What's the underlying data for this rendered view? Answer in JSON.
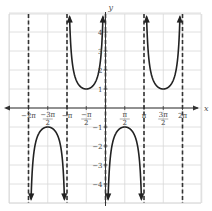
{
  "chart_data": {
    "type": "line",
    "title": "",
    "function": "y = -csc(x)",
    "xlabel": "x",
    "ylabel": "y",
    "xlim": [
      -2.5,
      2.5
    ],
    "xlim_units": "pi",
    "ylim": [
      -5,
      5
    ],
    "grid": true,
    "x_tick_labels": [
      "-2π",
      "-3π/2",
      "-π",
      "-π/2",
      "π/2",
      "π",
      "3π/2",
      "2π"
    ],
    "x_tick_values_pi": [
      -2,
      -1.5,
      -1,
      -0.5,
      0.5,
      1,
      1.5,
      2
    ],
    "y_tick_labels": [
      "-4",
      "-3",
      "-2",
      "-1",
      "1",
      "2",
      "3",
      "4"
    ],
    "y_tick_values": [
      -4,
      -3,
      -2,
      -1,
      1,
      2,
      3,
      4
    ],
    "asymptotes_pi": [
      -2,
      -1,
      0,
      1,
      2
    ],
    "series": [
      {
        "name": "branch-1",
        "domain_pi": [
          -2,
          -1
        ],
        "extremum": {
          "x_pi": -1.5,
          "y": -1
        },
        "shape": "opens-down"
      },
      {
        "name": "branch-2",
        "domain_pi": [
          -1,
          0
        ],
        "extremum": {
          "x_pi": -0.5,
          "y": 1
        },
        "shape": "opens-up"
      },
      {
        "name": "branch-3",
        "domain_pi": [
          0,
          1
        ],
        "extremum": {
          "x_pi": 0.5,
          "y": -1
        },
        "shape": "opens-down"
      },
      {
        "name": "branch-4",
        "domain_pi": [
          1,
          2
        ],
        "extremum": {
          "x_pi": 1.5,
          "y": 1
        },
        "shape": "opens-up"
      }
    ],
    "colors": {
      "curve": "#222222",
      "grid": "#d8d8d8",
      "axis": "#333333",
      "asymptote": "#333333"
    }
  }
}
